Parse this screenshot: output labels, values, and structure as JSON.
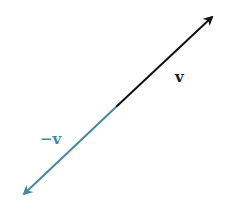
{
  "diagram": {
    "type": "vector-diagram",
    "vectors": [
      {
        "name": "v",
        "label": "v",
        "color": "#111111",
        "start": [
          116,
          107
        ],
        "end": [
          214,
          15
        ]
      },
      {
        "name": "negative-v",
        "label": "−v",
        "color": "#3f8aa5",
        "start": [
          116,
          107
        ],
        "end": [
          22,
          196
        ]
      }
    ]
  }
}
